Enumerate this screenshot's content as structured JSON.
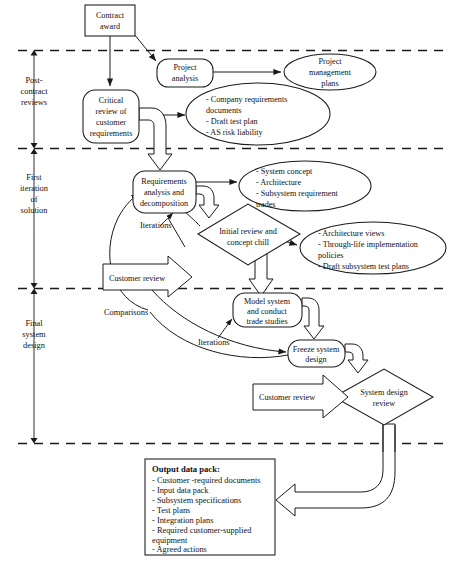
{
  "diagram": {
    "phases": [
      {
        "id": "post-contract",
        "label": "Post-\ncontract\nreviews",
        "lines": [
          "Post-",
          "contract",
          "reviews"
        ]
      },
      {
        "id": "first-iteration",
        "label": "First iteration of solution",
        "lines": [
          "First",
          "iteration",
          "of",
          "solution"
        ]
      },
      {
        "id": "final-design",
        "label": "Final system design",
        "lines": [
          "Final",
          "system",
          "design"
        ]
      }
    ],
    "nodes": {
      "contract_award": {
        "lines": [
          "Contract",
          "award"
        ],
        "shape": "rectangle"
      },
      "project_analysis": {
        "lines": [
          "Project",
          "analysis"
        ],
        "shape": "rounded-rectangle"
      },
      "project_management_plans": {
        "lines": [
          "Project",
          "management",
          "plans"
        ],
        "shape": "ellipse"
      },
      "critical_review": {
        "lines": [
          "Critical",
          "review of",
          "customer",
          "requirements"
        ],
        "shape": "rounded-rectangle"
      },
      "company_requirements": {
        "lines": [
          "- Company requirements",
          "  documents",
          "- Draft test plan",
          "- AS risk liability"
        ],
        "shape": "ellipse"
      },
      "requirements_analysis": {
        "lines": [
          "Requirements",
          "analysis and",
          "decomposition"
        ],
        "shape": "rounded-rectangle"
      },
      "system_concept": {
        "lines": [
          "- System concept",
          "- Architecture",
          "- Subsystem requirement",
          "  trades"
        ],
        "shape": "ellipse"
      },
      "architecture_views": {
        "lines": [
          "- Architecture views",
          "- Through-life implementation",
          "  policies",
          "- Draft subsystem test plans"
        ],
        "shape": "ellipse"
      },
      "initial_review": {
        "lines": [
          "Initial review and",
          "concept chill"
        ],
        "shape": "diamond"
      },
      "model_system": {
        "lines": [
          "Model system",
          "and conduct",
          "trade studies"
        ],
        "shape": "rounded-rectangle"
      },
      "freeze_system_design": {
        "lines": [
          "Freeze system",
          "design"
        ],
        "shape": "rounded-rectangle"
      },
      "system_design_review": {
        "lines": [
          "System design",
          "review"
        ],
        "shape": "diamond"
      },
      "customer_review_1": {
        "lines": [
          "Customer review"
        ],
        "shape": "block-arrow"
      },
      "customer_review_2": {
        "lines": [
          "Customer review"
        ],
        "shape": "block-arrow"
      }
    },
    "edge_labels": {
      "iterations_1": "Iterations",
      "iterations_2": "Iterations",
      "comparisons": "Comparisons"
    },
    "output_data_pack": {
      "title": "Output data pack:",
      "items": [
        "- Customer -required documents",
        "- Input data pack",
        "- Subsystem specifications",
        "- Test plans",
        "- Integration plans",
        "- Required customer-supplied",
        "  equipment",
        "- Agreed actions"
      ]
    },
    "colors": {
      "stroke": "#1a1a1a",
      "fill": "#ffffff",
      "text": "#111111"
    }
  }
}
